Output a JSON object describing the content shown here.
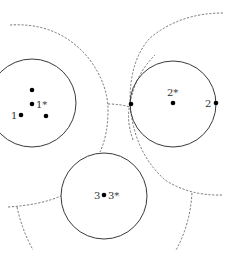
{
  "diagram": {
    "circles": [
      {
        "id": "circle-1",
        "cx": 32,
        "cy": 103,
        "r": 44
      },
      {
        "id": "circle-2",
        "cx": 173,
        "cy": 104,
        "r": 43
      },
      {
        "id": "circle-3",
        "cx": 104,
        "cy": 196,
        "r": 43
      }
    ],
    "points": [
      {
        "id": "p1a",
        "x": 32,
        "y": 90
      },
      {
        "id": "p1star",
        "x": 32,
        "y": 104
      },
      {
        "id": "p1",
        "x": 21,
        "y": 115
      },
      {
        "id": "p1b",
        "x": 46,
        "y": 116
      },
      {
        "id": "p2a",
        "x": 131,
        "y": 104
      },
      {
        "id": "p2star",
        "x": 173,
        "y": 103
      },
      {
        "id": "p2",
        "x": 216,
        "y": 103
      },
      {
        "id": "p3",
        "x": 104,
        "y": 195
      }
    ],
    "labels": {
      "l1": "1",
      "l1star": "1*",
      "l2": "2",
      "l2star": "2*",
      "l3": "3",
      "l3star": "3*"
    }
  }
}
